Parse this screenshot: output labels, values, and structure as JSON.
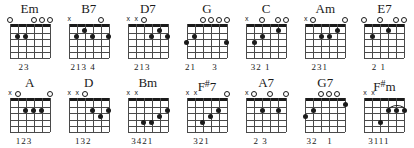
{
  "sheet": {
    "title": "Guitar Chord Diagrams",
    "strings": 6,
    "frets": 5,
    "marker_open": "o",
    "marker_muted": "x"
  },
  "rows": [
    {
      "chords": [
        {
          "name": "Em",
          "name_root": "Em",
          "accidental": "",
          "markers": [
            "o",
            "",
            "",
            "o",
            "o",
            "o"
          ],
          "dots": [
            {
              "string": 5,
              "fret": 2
            },
            {
              "string": 4,
              "fret": 2
            }
          ],
          "barre": null,
          "fingers": "23"
        },
        {
          "name": "B7",
          "name_root": "B7",
          "accidental": "",
          "markers": [
            "x",
            "",
            "",
            "",
            "o",
            ""
          ],
          "dots": [
            {
              "string": 5,
              "fret": 2
            },
            {
              "string": 4,
              "fret": 1
            },
            {
              "string": 3,
              "fret": 2
            },
            {
              "string": 1,
              "fret": 2
            }
          ],
          "barre": null,
          "fingers": "213 4"
        },
        {
          "name": "D7",
          "name_root": "D7",
          "accidental": "",
          "markers": [
            "x",
            "x",
            "o",
            "",
            "",
            ""
          ],
          "dots": [
            {
              "string": 3,
              "fret": 2
            },
            {
              "string": 2,
              "fret": 1
            },
            {
              "string": 1,
              "fret": 2
            }
          ],
          "barre": null,
          "fingers": "213"
        },
        {
          "name": "G",
          "name_root": "G",
          "accidental": "",
          "markers": [
            "",
            "",
            "o",
            "o",
            "o",
            "o"
          ],
          "dots": [
            {
              "string": 6,
              "fret": 3
            },
            {
              "string": 5,
              "fret": 2
            },
            {
              "string": 1,
              "fret": 3
            }
          ],
          "barre": null,
          "fingers": "21     3"
        },
        {
          "name": "C",
          "name_root": "C",
          "accidental": "",
          "markers": [
            "x",
            "",
            "o",
            "",
            "o",
            "o"
          ],
          "dots": [
            {
              "string": 5,
              "fret": 3
            },
            {
              "string": 4,
              "fret": 2
            },
            {
              "string": 2,
              "fret": 1
            }
          ],
          "barre": null,
          "fingers": "32 1"
        },
        {
          "name": "Am",
          "name_root": "Am",
          "accidental": "",
          "markers": [
            "x",
            "o",
            "",
            "",
            "",
            "o"
          ],
          "dots": [
            {
              "string": 4,
              "fret": 2
            },
            {
              "string": 3,
              "fret": 2
            },
            {
              "string": 2,
              "fret": 1
            }
          ],
          "barre": null,
          "fingers": "231"
        },
        {
          "name": "E7",
          "name_root": "E7",
          "accidental": "",
          "markers": [
            "o",
            "",
            "o",
            "",
            "o",
            "o"
          ],
          "dots": [
            {
              "string": 5,
              "fret": 2
            },
            {
              "string": 3,
              "fret": 1
            }
          ],
          "barre": null,
          "fingers": "2 1"
        }
      ]
    },
    {
      "chords": [
        {
          "name": "A",
          "name_root": "A",
          "accidental": "",
          "markers": [
            "x",
            "o",
            "",
            "",
            "",
            "o"
          ],
          "dots": [
            {
              "string": 4,
              "fret": 2
            },
            {
              "string": 3,
              "fret": 2
            },
            {
              "string": 2,
              "fret": 2
            }
          ],
          "barre": null,
          "fingers": "123"
        },
        {
          "name": "D",
          "name_root": "D",
          "accidental": "",
          "markers": [
            "x",
            "x",
            "o",
            "",
            "",
            ""
          ],
          "dots": [
            {
              "string": 3,
              "fret": 2
            },
            {
              "string": 2,
              "fret": 3
            },
            {
              "string": 1,
              "fret": 2
            }
          ],
          "barre": null,
          "fingers": "132"
        },
        {
          "name": "Bm",
          "name_root": "Bm",
          "accidental": "",
          "markers": [
            "x",
            "x",
            "",
            "",
            "",
            ""
          ],
          "dots": [
            {
              "string": 4,
              "fret": 4
            },
            {
              "string": 3,
              "fret": 4
            },
            {
              "string": 2,
              "fret": 3
            },
            {
              "string": 1,
              "fret": 2
            }
          ],
          "barre": null,
          "fingers": "3421"
        },
        {
          "name": "F#7",
          "name_root": "F",
          "accidental": "#",
          "name_suffix": "7",
          "markers": [
            "x",
            "x",
            "",
            "",
            "",
            "o"
          ],
          "dots": [
            {
              "string": 4,
              "fret": 4
            },
            {
              "string": 3,
              "fret": 3
            },
            {
              "string": 2,
              "fret": 2
            }
          ],
          "barre": null,
          "fingers": "321"
        },
        {
          "name": "A7",
          "name_root": "A7",
          "accidental": "",
          "markers": [
            "x",
            "o",
            "",
            "o",
            "",
            "o"
          ],
          "dots": [
            {
              "string": 4,
              "fret": 2
            },
            {
              "string": 2,
              "fret": 2
            }
          ],
          "barre": null,
          "fingers": "2 3"
        },
        {
          "name": "G7",
          "name_root": "G7",
          "accidental": "",
          "markers": [
            "",
            "",
            "o",
            "o",
            "o",
            ""
          ],
          "dots": [
            {
              "string": 6,
              "fret": 3
            },
            {
              "string": 5,
              "fret": 2
            },
            {
              "string": 1,
              "fret": 1
            }
          ],
          "barre": null,
          "fingers": "32   1"
        },
        {
          "name": "F#m",
          "name_root": "F",
          "accidental": "#",
          "name_suffix": "m",
          "markers": [
            "x",
            "x",
            "",
            "",
            "",
            ""
          ],
          "dots": [
            {
              "string": 4,
              "fret": 4
            },
            {
              "string": 3,
              "fret": 2
            },
            {
              "string": 2,
              "fret": 2
            },
            {
              "string": 1,
              "fret": 2
            }
          ],
          "barre": {
            "fret": 2,
            "from_string": 3,
            "to_string": 1
          },
          "fingers": "3111"
        }
      ]
    }
  ]
}
